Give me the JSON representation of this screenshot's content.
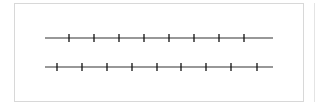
{
  "diagram": {
    "type": "number-lines",
    "line_color": "#333333",
    "tick_color": "#111111",
    "lines": [
      {
        "name": "top-number-line",
        "y": 38,
        "x_start": 45,
        "x_end": 273,
        "ticks": [
          69,
          94,
          119,
          144,
          169,
          194,
          219,
          244
        ]
      },
      {
        "name": "bottom-number-line",
        "y": 67,
        "x_start": 45,
        "x_end": 273,
        "ticks": [
          57,
          82,
          107,
          132,
          157,
          181,
          206,
          231,
          257
        ]
      }
    ]
  }
}
